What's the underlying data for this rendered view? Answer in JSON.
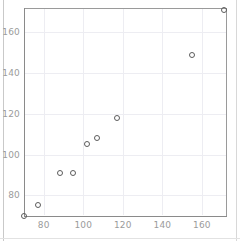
{
  "chart_data": {
    "type": "scatter",
    "title": "",
    "xlabel": "",
    "ylabel": "",
    "xlim": [
      70,
      172
    ],
    "ylim": [
      70,
      172
    ],
    "xticks": [
      80,
      100,
      120,
      140,
      160
    ],
    "yticks": [
      80,
      100,
      120,
      140,
      160
    ],
    "grid": true,
    "legend": null,
    "marker": "open-circle",
    "marker_color": "#5c5c5c",
    "series": [
      {
        "name": "series-1",
        "points": [
          {
            "x": 70,
            "y": 70
          },
          {
            "x": 77,
            "y": 75
          },
          {
            "x": 88,
            "y": 91
          },
          {
            "x": 95,
            "y": 91
          },
          {
            "x": 102,
            "y": 105
          },
          {
            "x": 107,
            "y": 108
          },
          {
            "x": 117,
            "y": 118
          },
          {
            "x": 155,
            "y": 149
          },
          {
            "x": 171,
            "y": 171
          }
        ]
      }
    ],
    "colors": {
      "background": "#ffffff",
      "grid": "#ededf2",
      "axis": "#8a8a8a",
      "tick_text": "#9b9b9b"
    }
  }
}
